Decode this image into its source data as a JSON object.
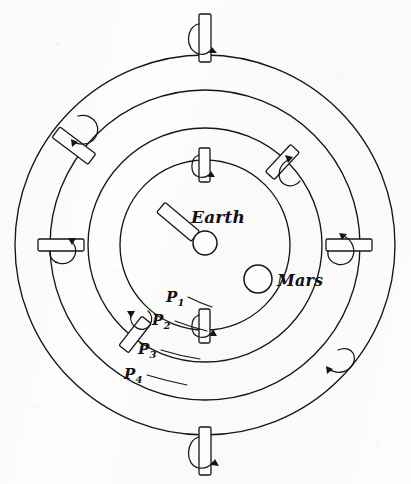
{
  "figure": {
    "background_color": "#fdfdfc",
    "ink_color": "#16161a",
    "center": {
      "x": 205,
      "y": 245
    }
  },
  "bodies": [
    {
      "id": "earth",
      "label": "Earth",
      "cx": 205,
      "cy": 243,
      "r": 12,
      "label_x": 191,
      "label_y": 207
    },
    {
      "id": "mars",
      "label": "Mars",
      "cx": 258,
      "cy": 279,
      "r": 14,
      "label_x": 277,
      "label_y": 271
    }
  ],
  "spheres": [
    {
      "id": "p1",
      "label": "P",
      "subscript": "1",
      "radius": 85,
      "label_x": 166,
      "label_y": 288
    },
    {
      "id": "p2",
      "label": "P",
      "subscript": "2",
      "radius": 117,
      "label_x": 152,
      "label_y": 311
    },
    {
      "id": "p3",
      "label": "P",
      "subscript": "3",
      "radius": 155,
      "label_x": 138,
      "label_y": 340
    },
    {
      "id": "p4",
      "label": "P",
      "subscript": "4",
      "radius": 190,
      "label_x": 124,
      "label_y": 365
    }
  ],
  "axle_pegs": [
    {
      "id": "peg-p4-top",
      "sphere": "p4",
      "angle_deg": -90,
      "rotation": "counterclockwise"
    },
    {
      "id": "peg-p4-bottom",
      "sphere": "p4",
      "angle_deg": 90,
      "rotation": "counterclockwise"
    },
    {
      "id": "peg-p3-upper-left",
      "sphere": "p3",
      "angle_deg": -143,
      "rotation": "counterclockwise"
    },
    {
      "id": "peg-p3-lower-right",
      "sphere": "p3",
      "angle_deg": 40,
      "rotation": "counterclockwise"
    },
    {
      "id": "peg-p3-left",
      "sphere": "p3",
      "angle_deg": 180,
      "rotation": "counterclockwise"
    },
    {
      "id": "peg-p3-right",
      "sphere": "p3",
      "angle_deg": 0,
      "rotation": "counterclockwise"
    },
    {
      "id": "peg-p2-upper-right",
      "sphere": "p2",
      "angle_deg": -47,
      "rotation": "counterclockwise"
    },
    {
      "id": "peg-p2-lower-left",
      "sphere": "p2",
      "angle_deg": 128,
      "rotation": "counterclockwise"
    },
    {
      "id": "peg-p1-top",
      "sphere": "p1",
      "angle_deg": -90,
      "rotation": "counterclockwise"
    },
    {
      "id": "peg-p1-bottom",
      "sphere": "p1",
      "angle_deg": 90,
      "rotation": "counterclockwise"
    }
  ],
  "leaders": [
    {
      "id": "leader-p1",
      "from_x": 188,
      "from_y": 297,
      "to_x": 211,
      "to_y": 306
    },
    {
      "id": "leader-p2",
      "from_x": 175,
      "from_y": 320,
      "to_x": 206,
      "to_y": 330
    },
    {
      "id": "leader-p3",
      "from_x": 161,
      "from_y": 349,
      "to_x": 199,
      "to_y": 358
    },
    {
      "id": "leader-p4",
      "from_x": 147,
      "from_y": 374,
      "to_x": 186,
      "to_y": 384
    }
  ]
}
